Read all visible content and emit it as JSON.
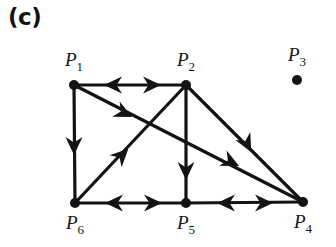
{
  "figure": {
    "panel_label": "(c)",
    "width": 336,
    "height": 247,
    "ink_color": "#131313",
    "background_color": "#ffffff"
  },
  "vertices": [
    {
      "id": "P1",
      "name": "P",
      "subscript": "1",
      "x": 74,
      "y": 85,
      "label_x": 74,
      "label_y": 66,
      "label_pos": "above"
    },
    {
      "id": "P2",
      "name": "P",
      "subscript": "2",
      "x": 186,
      "y": 85,
      "label_x": 186,
      "label_y": 66,
      "label_pos": "above"
    },
    {
      "id": "P3",
      "name": "P",
      "subscript": "3",
      "x": 297,
      "y": 80,
      "label_x": 297,
      "label_y": 61,
      "label_pos": "above"
    },
    {
      "id": "P4",
      "name": "P",
      "subscript": "4",
      "x": 303,
      "y": 202,
      "label_x": 303,
      "label_y": 228,
      "label_pos": "below"
    },
    {
      "id": "P5",
      "name": "P",
      "subscript": "5",
      "x": 186,
      "y": 203,
      "label_x": 186,
      "label_y": 229,
      "label_pos": "below"
    },
    {
      "id": "P6",
      "name": "P",
      "subscript": "6",
      "x": 75,
      "y": 203,
      "label_x": 75,
      "label_y": 229,
      "label_pos": "below"
    }
  ],
  "edges": [
    {
      "id": "e-p1-p2",
      "from": "P1",
      "to": "P2",
      "description": "top horizontal edge between P1 and P2"
    },
    {
      "id": "e-p1-p6",
      "from": "P1",
      "to": "P6",
      "description": "left vertical edge between P1 and P6"
    },
    {
      "id": "e-p2-p5",
      "from": "P2",
      "to": "P5",
      "description": "middle vertical edge between P2 and P5"
    },
    {
      "id": "e-p6-p5",
      "from": "P6",
      "to": "P5",
      "description": "bottom horizontal edge between P6 and P5"
    },
    {
      "id": "e-p5-p4",
      "from": "P5",
      "to": "P4",
      "description": "bottom horizontal edge between P5 and P4"
    },
    {
      "id": "e-p1-p4",
      "from": "P1",
      "to": "P4",
      "description": "long diagonal from P1 down to P4"
    },
    {
      "id": "e-p6-p2",
      "from": "P6",
      "to": "P2",
      "description": "diagonal from P6 up to P2"
    },
    {
      "id": "e-p2-p4",
      "from": "P2",
      "to": "P4",
      "description": "diagonal from P2 down to P4"
    }
  ],
  "arrowheads": [
    {
      "id": "a-p1p2-left",
      "edge": "e-p1-p2",
      "x": 113,
      "y": 85,
      "angle": 180,
      "direction": "left"
    },
    {
      "id": "a-p1p2-right",
      "edge": "e-p1-p2",
      "x": 152,
      "y": 85,
      "angle": 0,
      "direction": "right"
    },
    {
      "id": "a-p1p6-down",
      "edge": "e-p1-p6",
      "x": 74,
      "y": 146,
      "angle": 90,
      "direction": "down"
    },
    {
      "id": "a-p2p5-down",
      "edge": "e-p2-p5",
      "x": 186,
      "y": 171,
      "angle": 90,
      "direction": "down"
    },
    {
      "id": "a-p6p5-left",
      "edge": "e-p6-p5",
      "x": 114,
      "y": 203,
      "angle": 180,
      "direction": "left"
    },
    {
      "id": "a-p6p5-right",
      "edge": "e-p6-p5",
      "x": 153,
      "y": 203,
      "angle": 0,
      "direction": "right"
    },
    {
      "id": "a-p5p4-left",
      "edge": "e-p5-p4",
      "x": 226,
      "y": 203,
      "angle": 180,
      "direction": "left"
    },
    {
      "id": "a-p5p4-right",
      "edge": "e-p5-p4",
      "x": 264,
      "y": 203,
      "angle": 0,
      "direction": "right"
    },
    {
      "id": "a-p1p4-near",
      "edge": "e-p1-p4",
      "x": 124,
      "y": 113,
      "angle": 26,
      "direction": "down-right"
    },
    {
      "id": "a-p1p4-far",
      "edge": "e-p1-p4",
      "x": 231,
      "y": 162,
      "angle": 26,
      "direction": "down-right"
    },
    {
      "id": "a-p6p2-up",
      "edge": "e-p6-p2",
      "x": 122,
      "y": 155,
      "angle": -45,
      "direction": "up-right"
    },
    {
      "id": "a-p2p4-down",
      "edge": "e-p2-p4",
      "x": 247,
      "y": 144,
      "angle": 62,
      "direction": "down-right"
    }
  ]
}
